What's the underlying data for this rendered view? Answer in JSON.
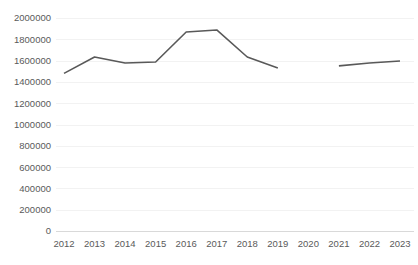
{
  "chart_data": {
    "type": "line",
    "title": "",
    "subtitle": "",
    "xlabel": "",
    "ylabel": "",
    "categories": [
      "2012",
      "2013",
      "2014",
      "2015",
      "2016",
      "2017",
      "2018",
      "2019",
      "2020",
      "2021",
      "2022",
      "2023"
    ],
    "series": [
      {
        "name": "Series 1",
        "color": "#595959",
        "values": [
          1480000,
          1634000,
          1577000,
          1587000,
          1869000,
          1888000,
          1634000,
          1531000,
          null,
          1550000,
          1577000,
          1596000
        ]
      }
    ],
    "ylim": [
      0,
      2000000
    ],
    "y_ticks": [
      0,
      200000,
      400000,
      600000,
      800000,
      1000000,
      1200000,
      1400000,
      1600000,
      1800000,
      2000000
    ],
    "y_tick_labels": [
      "0",
      "200000",
      "400000",
      "600000",
      "800000",
      "1000000",
      "1200000",
      "1400000",
      "1600000",
      "1800000",
      "2000000"
    ],
    "x_tick_labels": [
      "2012",
      "2013",
      "2014",
      "2015",
      "2016",
      "2017",
      "2018",
      "2019",
      "2020",
      "2021",
      "2022",
      "2023"
    ],
    "grid": true,
    "grid_axis": "y",
    "legend": false,
    "legend_position": "none",
    "gap_at": [
      "2020"
    ],
    "colors": {
      "line": "#595959",
      "grid": "#f2f2f2",
      "axis": "#d9d9d9",
      "text": "#5a5a5a",
      "background": "#ffffff"
    }
  },
  "plot_geometry": {
    "left": 64,
    "right": 400,
    "top": 18,
    "bottom": 231,
    "x_step": 30.5
  }
}
